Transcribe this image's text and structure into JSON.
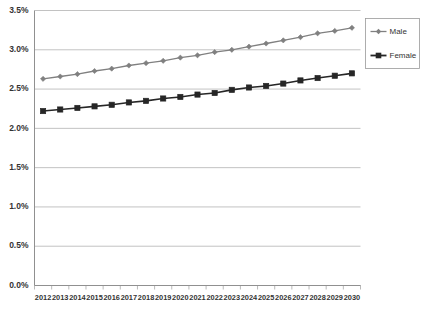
{
  "chart_data": {
    "type": "line",
    "title": "",
    "xlabel": "",
    "ylabel": "",
    "grid": true,
    "legend_position": "right",
    "ylim": [
      0,
      3.5
    ],
    "ytick_labels": [
      "0.0%",
      "0.5%",
      "1.0%",
      "1.5%",
      "2.0%",
      "2.5%",
      "3.0%",
      "3.5%"
    ],
    "ytick_values": [
      0,
      0.5,
      1.0,
      1.5,
      2.0,
      2.5,
      3.0,
      3.5
    ],
    "categories": [
      "2012",
      "2013",
      "2014",
      "2015",
      "2016",
      "2017",
      "2018",
      "2019",
      "2020",
      "2021",
      "2022",
      "2023",
      "2024",
      "2025",
      "2026",
      "2027",
      "2028",
      "2029",
      "2030"
    ],
    "series": [
      {
        "name": "Male",
        "color": "#808080",
        "marker": "diamond",
        "values": [
          2.63,
          2.66,
          2.69,
          2.73,
          2.76,
          2.8,
          2.83,
          2.86,
          2.9,
          2.93,
          2.97,
          3.0,
          3.04,
          3.08,
          3.12,
          3.16,
          3.21,
          3.24,
          3.28
        ]
      },
      {
        "name": "Female",
        "color": "#262626",
        "marker": "square",
        "values": [
          2.22,
          2.24,
          2.26,
          2.28,
          2.3,
          2.33,
          2.35,
          2.38,
          2.4,
          2.43,
          2.45,
          2.49,
          2.52,
          2.54,
          2.57,
          2.61,
          2.64,
          2.67,
          2.7
        ]
      }
    ]
  },
  "legend": {
    "entries": [
      {
        "label": "Male"
      },
      {
        "label": "Female"
      }
    ]
  }
}
